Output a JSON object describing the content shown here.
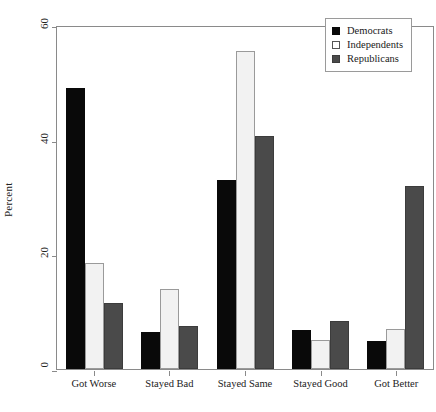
{
  "chart_data": {
    "type": "bar",
    "title": "",
    "subtitle": "",
    "xlabel": "",
    "ylabel": "Percent",
    "ylim": [
      0,
      60
    ],
    "yticks": [
      0,
      20,
      40,
      60
    ],
    "ytick_labels": [
      "0",
      "20",
      "40",
      "60"
    ],
    "grid": false,
    "legend_position": "top-right",
    "categories": [
      "Got Worse",
      "Stayed Bad",
      "Stayed Same",
      "Stayed Good",
      "Got Better"
    ],
    "series": [
      {
        "name": "Democrats",
        "color": "#090909",
        "values": [
          49.0,
          6.5,
          33.0,
          6.8,
          4.8
        ]
      },
      {
        "name": "Independents",
        "color": "#f2f2f2",
        "values": [
          18.5,
          14.0,
          55.5,
          5.0,
          7.0
        ]
      },
      {
        "name": "Republicans",
        "color": "#4a4a4a",
        "values": [
          11.5,
          7.5,
          40.7,
          8.4,
          32.0
        ]
      }
    ]
  },
  "legend": {
    "items": [
      {
        "label": "Democrats",
        "swatch": "filled-black-square"
      },
      {
        "label": "Independents",
        "swatch": "open-white-square"
      },
      {
        "label": "Republicans",
        "swatch": "filled-gray-square"
      }
    ]
  },
  "caption": {
    "text": "",
    "note": "cut-off-illegible"
  },
  "colors": {
    "democrats": "#090909",
    "independents": "#f2f2f2",
    "republicans": "#4a4a4a",
    "axis": "#8a8a8a",
    "background": "#ffffff"
  }
}
